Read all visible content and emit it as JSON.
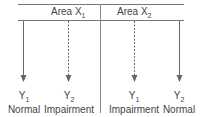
{
  "areas": [
    {
      "label": "Area X",
      "sub": "1"
    },
    {
      "label": "Area X",
      "sub": "2"
    }
  ],
  "outputs": [
    {
      "var": "Y",
      "sub": "1",
      "state": "Normal",
      "line": "solid"
    },
    {
      "var": "Y",
      "sub": "2",
      "state": "Impairment",
      "line": "dashed"
    },
    {
      "var": "Y",
      "sub": "1",
      "state": "Impairment",
      "line": "dashed"
    },
    {
      "var": "Y",
      "sub": "2",
      "state": "Normal",
      "line": "solid"
    }
  ]
}
